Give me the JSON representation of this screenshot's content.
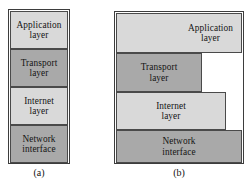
{
  "figure": {
    "panel_a": {
      "caption": "(a)",
      "layers": [
        {
          "label": "Application layer",
          "line1": "Application",
          "line2": "layer",
          "tone": "light"
        },
        {
          "label": "Transport layer",
          "line1": "Transport",
          "line2": "layer",
          "tone": "dark"
        },
        {
          "label": "Internet layer",
          "line1": "Internet",
          "line2": "layer",
          "tone": "light"
        },
        {
          "label": "Network interface",
          "line1": "Network",
          "line2": "interface",
          "tone": "dark"
        }
      ]
    },
    "panel_b": {
      "caption": "(b)",
      "layers": [
        {
          "label": "Application layer",
          "line1": "Application",
          "line2": "layer",
          "tone": "light"
        },
        {
          "label": "Transport layer",
          "line1": "Transport",
          "line2": "layer",
          "tone": "dark"
        },
        {
          "label": "Internet layer",
          "line1": "Internet",
          "line2": "layer",
          "tone": "light"
        },
        {
          "label": "Network interface",
          "line1": "Network",
          "line2": "interface",
          "tone": "dark"
        }
      ]
    },
    "colors": {
      "tone_light": "#d9d9d9",
      "tone_dark": "#a9a9a9",
      "border": "#4a4a4a",
      "text": "#141414",
      "background": "#ffffff"
    }
  }
}
